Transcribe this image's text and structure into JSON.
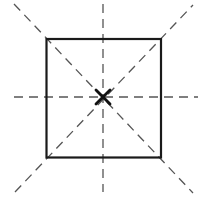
{
  "diagram": {
    "title": "",
    "colors": {
      "background": "#ffffff",
      "square_stroke": "#1a1a1a",
      "symmetry_line_stroke": "#555555",
      "center_mark_stroke": "#111111"
    },
    "square": {
      "x": 46.5,
      "y": 39,
      "width": 114.5,
      "height": 118.5
    },
    "center": {
      "x": 103,
      "y": 97,
      "mark": "x-mark",
      "half_size": 7
    },
    "symmetry_lines": [
      {
        "name": "vertical",
        "x1": 103,
        "y1": 4,
        "x2": 103,
        "y2": 192
      },
      {
        "name": "horizontal",
        "x1": 14,
        "y1": 97,
        "x2": 198,
        "y2": 97
      },
      {
        "name": "diagonal-down",
        "x1": 14,
        "y1": 4,
        "x2": 193,
        "y2": 193
      },
      {
        "name": "diagonal-up",
        "x1": 15,
        "y1": 192,
        "x2": 193,
        "y2": 5
      }
    ]
  }
}
